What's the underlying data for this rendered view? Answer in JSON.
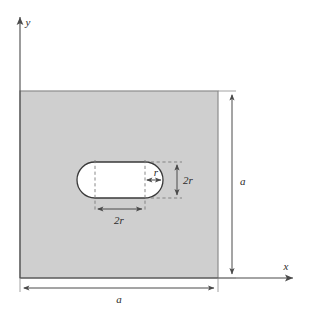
{
  "figure": {
    "colors": {
      "plate_fill": "#cfcfcf",
      "plate_stroke": "#8c8c8c",
      "hole_fill": "#ffffff",
      "hole_stroke": "#3a3a3a",
      "line": "#4a4a4a",
      "dashed": "#7a7a7a",
      "text": "#2b2b2b",
      "background": "#ffffff"
    },
    "axes": {
      "x_label": "x",
      "y_label": "y",
      "origin_x": 20,
      "origin_y": 278,
      "x_tip_x": 297,
      "y_tip_y": 13,
      "x_label_pos": {
        "x": 286,
        "y": 270
      },
      "y_label_pos": {
        "x": 28,
        "y": 26
      }
    },
    "plate": {
      "x": 20,
      "y": 91,
      "width": 198,
      "height": 187,
      "side_label": "a"
    },
    "hole": {
      "shape": "capsule",
      "left_cap_center_x": 95,
      "right_cap_center_x": 145,
      "center_y": 180,
      "radius": 18,
      "straight_left_x": 95,
      "straight_right_x": 145,
      "top_y": 162,
      "bottom_y": 198
    },
    "dimensions": [
      {
        "name": "plate-height",
        "label": "a",
        "orientation": "vertical",
        "line_x": 232,
        "from_y": 91,
        "to_y": 278,
        "label_pos": {
          "x": 238,
          "y": 188
        }
      },
      {
        "name": "plate-width",
        "label": "a",
        "orientation": "horizontal",
        "line_y": 288,
        "from_x": 20,
        "to_x": 218,
        "label_pos": {
          "x": 119,
          "y": 302
        }
      },
      {
        "name": "hole-height",
        "label": "2r",
        "orientation": "vertical",
        "line_x": 177,
        "from_y": 162,
        "to_y": 198,
        "label_pos": {
          "x": 184,
          "y": 184
        }
      },
      {
        "name": "hole-straight-length",
        "label": "2r",
        "orientation": "horizontal",
        "line_y": 209,
        "from_x": 95,
        "to_x": 145,
        "label_pos": {
          "x": 112,
          "y": 224
        }
      },
      {
        "name": "cap-radius",
        "label": "r",
        "orientation": "horizontal",
        "line_y": 180,
        "from_x": 145,
        "to_x": 163,
        "label_pos": {
          "x": 150,
          "y": 175
        }
      }
    ],
    "extension_lines": [
      {
        "name": "hole-top-extension",
        "x1": 145,
        "y1": 162,
        "x2": 182,
        "y2": 162
      },
      {
        "name": "hole-bottom-extension",
        "x1": 145,
        "y1": 198,
        "x2": 182,
        "y2": 198
      },
      {
        "name": "hole-left-vertical",
        "x1": 95,
        "y1": 160,
        "x2": 95,
        "y2": 212
      },
      {
        "name": "hole-right-vertical",
        "x1": 145,
        "y1": 160,
        "x2": 145,
        "y2": 212
      }
    ]
  }
}
